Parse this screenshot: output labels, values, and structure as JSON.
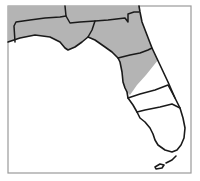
{
  "map": {
    "subject": "Florida",
    "colors": {
      "shaded_region": "#b4b4b4",
      "unshaded_region": "#ffffff",
      "border": "#1a1a1a",
      "frame": "#9a9a9a"
    },
    "regions": [
      {
        "id": "northwest-top",
        "shaded": true
      },
      {
        "id": "panhandle-west",
        "shaded": true
      },
      {
        "id": "north-central",
        "shaded": true
      },
      {
        "id": "northeast-central",
        "shaded": true
      },
      {
        "id": "central",
        "shaded": false
      },
      {
        "id": "south-central",
        "shaded": false
      },
      {
        "id": "south",
        "shaded": false
      }
    ]
  }
}
